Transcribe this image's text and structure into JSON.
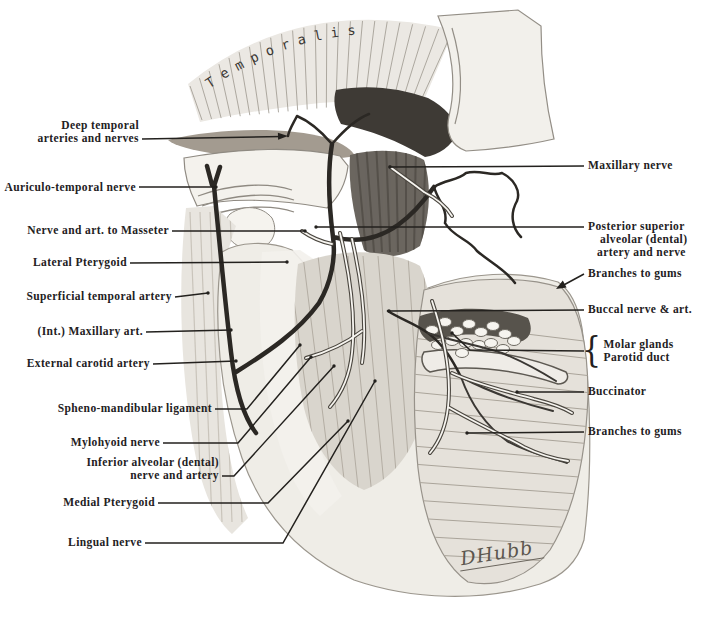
{
  "figure": {
    "temporalis_label": "Temporalis",
    "signature": "DHubb"
  },
  "colors": {
    "paper": "#ffffff",
    "ink": "#23211e",
    "bone": "#f4f2ed",
    "shade_gray": "#a39b90",
    "dark_muscle": "#3e3a35",
    "vessel_dark": "#2b2824",
    "nerve_cord": "#f7f5f0"
  },
  "labels": {
    "left": [
      {
        "lines": [
          "Deep temporal",
          "arteries and nerves"
        ]
      },
      {
        "lines": [
          "Auriculo-temporal nerve"
        ]
      },
      {
        "lines": [
          "Nerve and art. to Masseter"
        ]
      },
      {
        "lines": [
          "Lateral Pterygoid"
        ]
      },
      {
        "lines": [
          "Superficial temporal artery"
        ]
      },
      {
        "lines": [
          "(Int.) Maxillary art."
        ]
      },
      {
        "lines": [
          "External carotid artery"
        ]
      },
      {
        "lines": [
          "Spheno-mandibular ligament"
        ]
      },
      {
        "lines": [
          "Mylohyoid nerve"
        ]
      },
      {
        "lines": [
          "Inferior alveolar (dental)",
          "nerve and artery"
        ]
      },
      {
        "lines": [
          "Medial Pterygoid"
        ]
      },
      {
        "lines": [
          "Lingual nerve"
        ]
      }
    ],
    "right": [
      {
        "lines": [
          "Maxillary nerve"
        ]
      },
      {
        "lines": [
          "Posterior superior",
          "alveolar (dental)",
          "artery and nerve"
        ]
      },
      {
        "lines": [
          "Branches to gums"
        ]
      },
      {
        "lines": [
          "Buccal nerve & art."
        ]
      },
      {
        "brace": "{",
        "lines": [
          "Molar glands",
          "Parotid duct"
        ]
      },
      {
        "lines": [
          "Buccinator"
        ]
      },
      {
        "lines": [
          "Branches to gums"
        ]
      }
    ]
  }
}
